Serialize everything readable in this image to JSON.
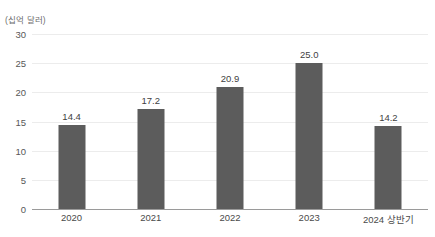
{
  "chart_data": {
    "type": "bar",
    "title": "",
    "subtitle": "",
    "unit_caption": "(십억 달러)",
    "xlabel": "",
    "ylabel": "",
    "categories": [
      "2020",
      "2021",
      "2022",
      "2023",
      "2024 상반기"
    ],
    "values": [
      14.4,
      17.2,
      20.9,
      25.0,
      14.2
    ],
    "data_labels": [
      "14.4",
      "17.2",
      "20.9",
      "25.0",
      "14.2"
    ],
    "ylim": [
      0,
      30
    ],
    "yticks": [
      0,
      5,
      10,
      15,
      20,
      25,
      30
    ],
    "ytick_labels": [
      "0",
      "5",
      "10",
      "15",
      "20",
      "25",
      "30"
    ],
    "grid": true,
    "legend": false,
    "legend_position": "none",
    "series": [
      {
        "name": "",
        "values": [
          14.4,
          17.2,
          20.9,
          25.0,
          14.2
        ]
      }
    ],
    "colors": {
      "bar": "#5c5c5c",
      "gridline": "#ececec",
      "axis": "#9a9a9a",
      "tick_text": "#575757",
      "value_text": "#3f3f3f",
      "caption_text": "#6d6d6d",
      "background": "#ffffff"
    }
  }
}
